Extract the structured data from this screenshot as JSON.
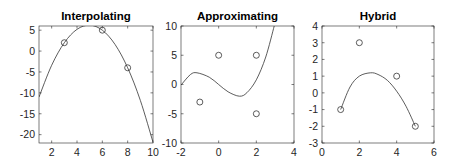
{
  "chart_data": [
    {
      "type": "line",
      "title": "Interpolating",
      "xlabel": "",
      "ylabel": "",
      "xlim": [
        1,
        10
      ],
      "ylim": [
        -22,
        6
      ],
      "xticks": [
        2,
        4,
        6,
        8,
        10
      ],
      "yticks": [
        -20,
        -15,
        -10,
        -5,
        0,
        5
      ],
      "grid": false,
      "series": [
        {
          "name": "data points",
          "style": "markers",
          "x": [
            3,
            6,
            8
          ],
          "y": [
            2,
            5,
            -4
          ]
        },
        {
          "name": "interpolating polynomial",
          "style": "line",
          "x": [
            1,
            2,
            3,
            4,
            5,
            6,
            7,
            8,
            9,
            10
          ],
          "y": [
            -11,
            -3.4,
            2,
            5.2,
            6.2,
            5,
            1.6,
            -4,
            -11.8,
            -21.8
          ]
        }
      ]
    },
    {
      "type": "line",
      "title": "Approximating",
      "xlabel": "",
      "ylabel": "",
      "xlim": [
        -2,
        4
      ],
      "ylim": [
        -10,
        10
      ],
      "xticks": [
        -2,
        0,
        2,
        4
      ],
      "yticks": [
        -10,
        -5,
        0,
        5,
        10
      ],
      "grid": false,
      "series": [
        {
          "name": "data points",
          "style": "markers",
          "x": [
            -1,
            0,
            2,
            2
          ],
          "y": [
            -3,
            5,
            5,
            -5
          ]
        },
        {
          "name": "approximating polynomial",
          "style": "line",
          "x": [
            -2,
            -1.5,
            -1.15,
            -0.5,
            0,
            0.5,
            1.1,
            1.5,
            2,
            2.5,
            2.95
          ],
          "y": [
            -0.1,
            1.7,
            2.0,
            1.25,
            0,
            -1.25,
            -2.0,
            -1.4,
            0.8,
            4.7,
            10.0
          ]
        }
      ]
    },
    {
      "type": "line",
      "title": "Hybrid",
      "xlabel": "",
      "ylabel": "",
      "xlim": [
        0,
        6
      ],
      "ylim": [
        -3,
        4
      ],
      "xticks": [
        0,
        2,
        4,
        6
      ],
      "yticks": [
        -3,
        -2,
        -1,
        0,
        1,
        2,
        3,
        4
      ],
      "grid": false,
      "series": [
        {
          "name": "data points",
          "style": "markers",
          "x": [
            1,
            2,
            4,
            5
          ],
          "y": [
            -1,
            3,
            1,
            -2
          ]
        },
        {
          "name": "hybrid polynomial",
          "style": "line",
          "x": [
            1,
            1.5,
            2,
            2.6,
            3,
            3.5,
            4,
            4.5,
            5
          ],
          "y": [
            -1,
            0.35,
            1.0,
            1.2,
            1.1,
            0.75,
            0.1,
            -0.8,
            -2
          ]
        }
      ]
    }
  ],
  "layout": {
    "panels": [
      {
        "left": 39,
        "top": 26,
        "right": 153,
        "bottom": 143
      },
      {
        "left": 181,
        "top": 26,
        "right": 294,
        "bottom": 143
      },
      {
        "left": 322,
        "top": 26,
        "right": 434,
        "bottom": 143
      }
    ]
  }
}
